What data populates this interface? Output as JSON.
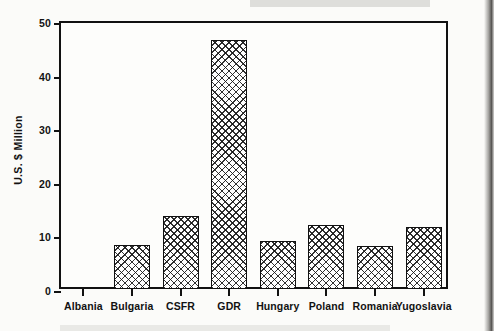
{
  "chart_data": {
    "type": "bar",
    "title": "",
    "xlabel": "",
    "ylabel": "U.S. $ Million",
    "ylim": [
      0,
      50
    ],
    "yticks": [
      0,
      10,
      20,
      30,
      40,
      50
    ],
    "ytick_labels": [
      "0",
      "10",
      "20",
      "30",
      "40",
      "50"
    ],
    "grid": false,
    "legend": "none",
    "bar_style": "cross-hatch fill with black outline",
    "categories": [
      "Albania",
      "Bulgaria",
      "CSFR",
      "GDR",
      "Hungary",
      "Poland",
      "Romania",
      "Yugoslavia"
    ],
    "values": [
      0,
      8.2,
      13.6,
      46.5,
      9.0,
      11.9,
      8.0,
      11.6
    ]
  },
  "axis": {
    "y_title": "U.S. $ Million",
    "y_ticks": [
      {
        "label": "50",
        "value": 50
      },
      {
        "label": "40",
        "value": 40
      },
      {
        "label": "30",
        "value": 30
      },
      {
        "label": "20",
        "value": 20
      },
      {
        "label": "10",
        "value": 10
      },
      {
        "label": "0",
        "value": 0
      }
    ]
  },
  "bars": [
    {
      "label": "Albania",
      "value": 0
    },
    {
      "label": "Bulgaria",
      "value": 8.2
    },
    {
      "label": "CSFR",
      "value": 13.6
    },
    {
      "label": "GDR",
      "value": 46.5
    },
    {
      "label": "Hungary",
      "value": 9.0
    },
    {
      "label": "Poland",
      "value": 11.9
    },
    {
      "label": "Romania",
      "value": 8.0
    },
    {
      "label": "Yugoslavia",
      "value": 11.6
    }
  ],
  "colors": {
    "ink": "#111111",
    "page": "#fbfbf9",
    "plot_background": "#fdfdfb"
  }
}
